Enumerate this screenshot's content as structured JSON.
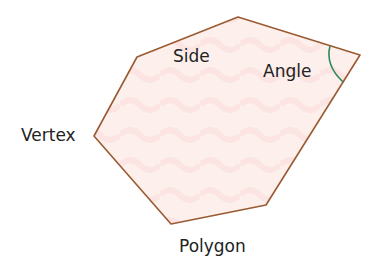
{
  "diagram": {
    "title": "Polygon",
    "labels": {
      "side": "Side",
      "angle": "Angle",
      "vertex": "Vertex",
      "polygon": "Polygon"
    },
    "vertices": [
      [
        137,
        57
      ],
      [
        238,
        17
      ],
      [
        360,
        55
      ],
      [
        266,
        205
      ],
      [
        171,
        224
      ],
      [
        94,
        136
      ]
    ],
    "colors": {
      "outline": "#9a5a32",
      "fill": "#fdeeea",
      "angle_arc": "#2e8a5a",
      "text": "#222222"
    }
  }
}
